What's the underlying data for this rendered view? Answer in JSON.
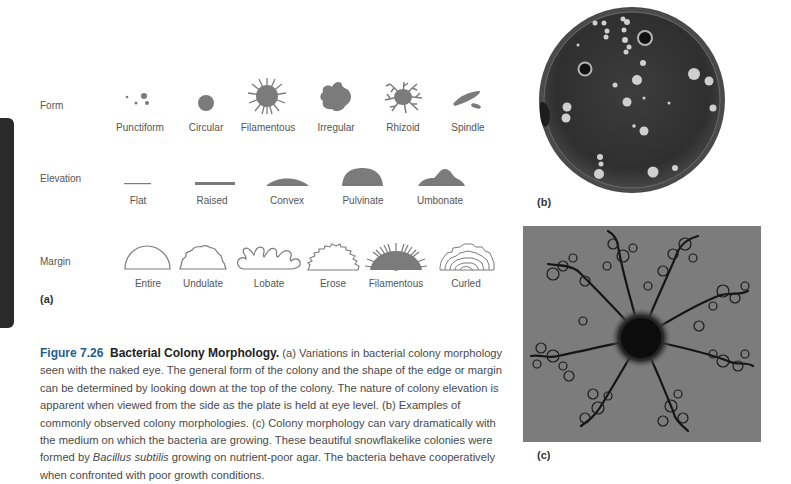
{
  "figure": {
    "number": "Figure 7.26",
    "title": "Bacterial Colony Morphology.",
    "caption_parts": [
      " (a) Variations in bacterial colony morphology seen with the naked eye. The general form of the colony and the shape of the edge or margin can be determined by looking down at the top of the colony. The nature of colony elevation is apparent when viewed from the side as the plate is held at eye level. (b) Examples of commonly observed colony morphologies. (c) Colony morphology can vary dramatically with the medium on which the bacteria are growing. These beautiful snowflakelike colonies were formed by ",
      "Bacillus subtilis",
      " growing on nutrient-poor agar. The bacteria behave cooperatively when confronted with poor growth conditions."
    ]
  },
  "panel_a": {
    "tag": "(a)",
    "rows": {
      "form": {
        "label": "Form",
        "items": [
          "Punctiform",
          "Circular",
          "Filamentous",
          "Irregular",
          "Rhizoid",
          "Spindle"
        ]
      },
      "elevation": {
        "label": "Elevation",
        "items": [
          "Flat",
          "Raised",
          "Convex",
          "Pulvinate",
          "Umbonate"
        ]
      },
      "margin": {
        "label": "Margin",
        "items": [
          "Entire",
          "Undulate",
          "Lobate",
          "Erose",
          "Filamentous",
          "Curled"
        ]
      }
    }
  },
  "panel_b": {
    "tag": "(b)",
    "description": "Petri dish with bacterial colonies"
  },
  "panel_c": {
    "tag": "(c)",
    "description": "Snowflakelike Bacillus subtilis colonies"
  },
  "colors": {
    "shape_fill": "#7b7b7b",
    "title_blue": "#1e5f8c",
    "side_tab": "#2a2a2a"
  }
}
